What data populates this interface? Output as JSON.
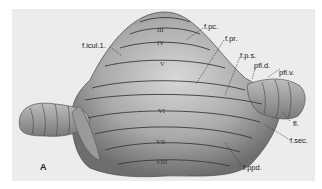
{
  "figure": {
    "panel_label": "A",
    "lobule_numerals": [
      "III",
      "IV",
      "V",
      "VI",
      "VII",
      "VIII"
    ],
    "labels": {
      "f_icul": "f.icul.1.",
      "f_pc": "f.pc.",
      "f_pr": "f.pr.",
      "f_ps": "f.p.s.",
      "pfl_d": "pfl.d.",
      "pfl_v": "pfl.v.",
      "fl": "fl.",
      "f_sec": "f.sec.",
      "f_ppd": "f.ppd."
    }
  }
}
